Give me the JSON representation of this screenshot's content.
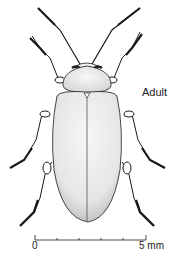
{
  "figure": {
    "stage_label": "Adult",
    "scale_bar": {
      "start_label": "0",
      "end_label": "5 mm",
      "ticks": 6
    },
    "colors": {
      "ink": "#1a1a1a",
      "body_fill": "#ececec",
      "shade": "#bdbdbd",
      "background": "#ffffff"
    }
  }
}
